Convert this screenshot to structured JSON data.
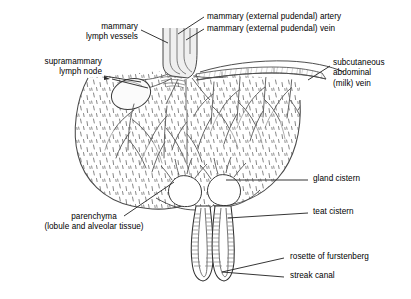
{
  "figure": {
    "background_color": "#ffffff",
    "line_color": "#1a1a1a",
    "tissue_line_color": "#6b6b6b",
    "vessel_color": "#555555",
    "leader_color": "#2b2b2b"
  },
  "labels": {
    "mammary_lymph_vessels": "mammary\nlymph vessels",
    "supramammary_lymph_node": "supramammary\nlymph node",
    "mammary_artery": "mammary (external pudendal) artery",
    "mammary_vein": "mammary (external pudendal) vein",
    "subcutaneous_abdominal_vein": "subcutaneous\nabdominal\n(milk) vein",
    "gland_cistern": "gland cistern",
    "teat_cistern": "teat cistern",
    "rosette_of_furstenberg": "rosette of furstenberg",
    "streak_canal": "streak canal",
    "parenchyma": "parenchyma\n(lobule and alveolar tissue)"
  },
  "structures": [
    {
      "name": "udder-body",
      "description": "large sac of glandular parenchyma"
    },
    {
      "name": "supramammary-lymph-node",
      "description": "oval node at upper left of gland"
    },
    {
      "name": "vascular-trunk",
      "description": "artery and vein bundle entering at top"
    },
    {
      "name": "skin-band",
      "description": "hatched subcutaneous band along upper right margin"
    },
    {
      "name": "gland-cistern-left",
      "description": "rounded milk collecting chamber"
    },
    {
      "name": "gland-cistern-right",
      "description": "rounded milk collecting chamber"
    },
    {
      "name": "teat-left",
      "description": "left teat with ribbed cistern lining"
    },
    {
      "name": "teat-right",
      "description": "right teat with ribbed cistern lining"
    },
    {
      "name": "streak-canal",
      "description": "canal at teat apex"
    }
  ]
}
